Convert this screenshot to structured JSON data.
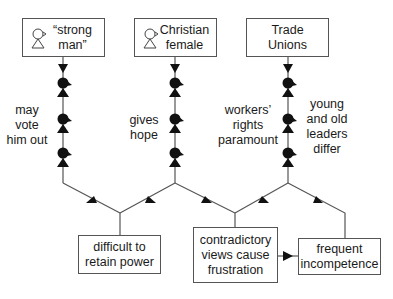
{
  "actors": [
    {
      "label": "“strong\nman”",
      "icon": "person-outline-icon"
    },
    {
      "label": "Christian\nfemale",
      "icon": "person-outline-icon"
    },
    {
      "label": "Trade\nUnions"
    }
  ],
  "influence_labels": [
    "may\nvote\nhim out",
    "gives\nhope",
    "workers’\nrights\nparamount",
    "young\nand old\nleaders\ndiffer"
  ],
  "outcomes": [
    {
      "label": "difficult to\nretain power"
    },
    {
      "label": "contradictory\nviews cause\nfrustration"
    },
    {
      "label": "frequent\nincompetence"
    }
  ],
  "caption": "(partially visible caption)",
  "colors": {
    "line": "#555555",
    "figure": "#111111",
    "text": "#1a1a1a"
  }
}
